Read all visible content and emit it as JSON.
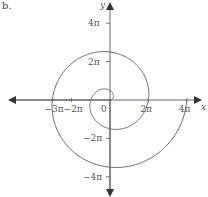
{
  "figure": {
    "part_label": "b.",
    "axis_color": "#555555",
    "curve_color": "#666666"
  },
  "chart_data": {
    "type": "line",
    "title": "",
    "xlabel": "x",
    "ylabel": "y",
    "x_ticks": [
      {
        "value": -3,
        "label": "−3π"
      },
      {
        "value": -2,
        "label": "−2π"
      },
      {
        "value": 0,
        "label": "0"
      },
      {
        "value": 2,
        "label": "2π"
      },
      {
        "value": 4,
        "label": "4π"
      }
    ],
    "y_ticks": [
      {
        "value": 4,
        "label": "4π"
      },
      {
        "value": 2,
        "label": "2π"
      },
      {
        "value": -2,
        "label": "−2π"
      },
      {
        "value": -4,
        "label": "−4π"
      }
    ],
    "xlim_pi": [
      -4.1,
      4.6
    ],
    "ylim_pi": [
      -5.0,
      5.3
    ],
    "grid": false,
    "legend": null,
    "key_points_pi": [
      {
        "theta": 0,
        "x": 0,
        "y": 0
      },
      {
        "theta": 0.5,
        "x": 0,
        "y": 0.5
      },
      {
        "theta": 1,
        "x": -1,
        "y": 0
      },
      {
        "theta": 1.5,
        "x": 0,
        "y": -1.5
      },
      {
        "theta": 2,
        "x": 2,
        "y": 0
      },
      {
        "theta": 2.5,
        "x": 0,
        "y": 2.5
      },
      {
        "theta": 3,
        "x": -3,
        "y": 0
      },
      {
        "theta": 3.5,
        "x": 0,
        "y": -3.5
      },
      {
        "theta": 4,
        "x": 4,
        "y": 0
      }
    ],
    "curve": {
      "equation": "r = θ",
      "theta_start_pi": 0,
      "theta_end_pi": 4
    }
  }
}
